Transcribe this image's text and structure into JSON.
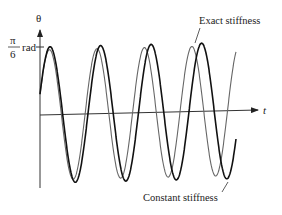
{
  "chart_data": {
    "type": "line",
    "title": "",
    "xlabel": "t",
    "ylabel": "θ",
    "y_tick_label": {
      "numerator": "π",
      "denominator": "6",
      "unit": "rad"
    },
    "y_tick_value_rad": 0.5236,
    "xlim": [
      0,
      4.3
    ],
    "ylim": [
      -0.63,
      0.6
    ],
    "grid": false,
    "annotations": [
      {
        "text": "Exact stiffness",
        "target_series": "Exact stiffness",
        "placement": "top-right"
      },
      {
        "text": "Constant stiffness",
        "target_series": "Constant stiffness",
        "placement": "bottom-right"
      }
    ],
    "series": [
      {
        "name": "Constant stiffness",
        "color": "#111111",
        "amplitude_rad": 0.5236,
        "cycles_shown": 4.3,
        "period": 1.0,
        "phase_drift_per_cycle": 0
      },
      {
        "name": "Exact stiffness",
        "color": "#666666",
        "amplitude_rad": 0.5,
        "cycles_shown": 4.5,
        "period": 0.94,
        "phase_drift_per_cycle": 0.06
      }
    ]
  }
}
